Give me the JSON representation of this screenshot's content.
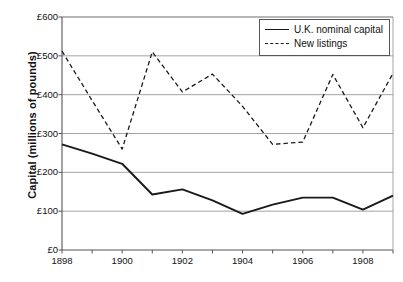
{
  "chart_data": {
    "type": "line",
    "title": "",
    "xlabel": "",
    "ylabel": "Capital (millions of pounds)",
    "x": [
      1898,
      1899,
      1900,
      1901,
      1902,
      1903,
      1904,
      1905,
      1906,
      1907,
      1908,
      1909
    ],
    "xlim": [
      1898,
      1909
    ],
    "ylim": [
      0,
      600
    ],
    "ytick_values": [
      0,
      100,
      200,
      300,
      400,
      500,
      600
    ],
    "ytick_labels": [
      "£0",
      "£100",
      "£200",
      "£300",
      "£400",
      "£500",
      "£600"
    ],
    "xtick_values": [
      1898,
      1900,
      1902,
      1904,
      1906,
      1908
    ],
    "xtick_labels": [
      "1898",
      "1900",
      "1902",
      "1904",
      "1906",
      "1908"
    ],
    "xminor_values": [
      1899,
      1901,
      1903,
      1905,
      1907,
      1909
    ],
    "grid": "horizontal",
    "legend_position": "top-right",
    "series": [
      {
        "name": "U.K. nominal capital",
        "style": "solid",
        "color": "#1a1a1a",
        "values": [
          272,
          248,
          222,
          143,
          156,
          128,
          93,
          117,
          135,
          135,
          104,
          140
        ]
      },
      {
        "name": "New listings",
        "style": "dashed",
        "color": "#1a1a1a",
        "values": [
          512,
          385,
          260,
          510,
          407,
          453,
          370,
          272,
          278,
          452,
          315,
          455
        ]
      }
    ]
  },
  "legend": {
    "items": [
      {
        "label": "U.K. nominal capital",
        "style": "solid"
      },
      {
        "label": "New listings",
        "style": "dashed"
      }
    ]
  }
}
